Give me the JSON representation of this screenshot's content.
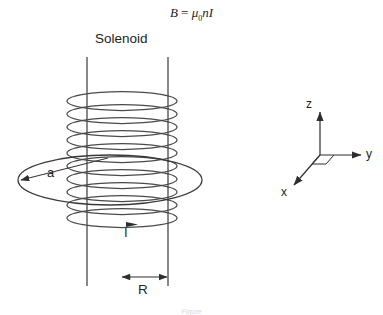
{
  "figure": {
    "title_formula": {
      "lhs": "B",
      "equals": "=",
      "mu": "μ",
      "mu_sub": "0",
      "rhs_tail": "nI",
      "plain": "B = μ0nI"
    },
    "labels": {
      "solenoid": "Solenoid",
      "radius": "a",
      "current": "I",
      "gap": "R"
    },
    "axes": {
      "z": "z",
      "y": "y",
      "x": "x"
    },
    "caption": "Figure",
    "colors": {
      "stroke": "#3a3a3a",
      "coil": "#4a4a4a",
      "text": "#232323",
      "background": "#ffffff"
    }
  }
}
